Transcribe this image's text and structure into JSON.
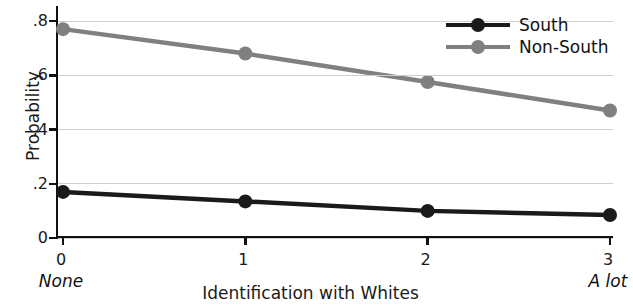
{
  "chart_data": {
    "type": "line",
    "title": "",
    "xlabel": "Identification with Whites",
    "ylabel": "Probability",
    "x": [
      0,
      1,
      2,
      3
    ],
    "xticklabels": [
      "0",
      "1",
      "2",
      "3"
    ],
    "x_end_labels": {
      "left": "None",
      "right": "A lot"
    },
    "xlim": [
      0,
      3
    ],
    "ylim": [
      0,
      0.8
    ],
    "yticks": [
      0,
      0.2,
      0.4,
      0.6,
      0.8
    ],
    "yticklabels": [
      "0",
      ".2",
      ".4",
      ".6",
      ".8"
    ],
    "grid": "horizontal",
    "legend_position": "top-right",
    "series": [
      {
        "name": "South",
        "color": "#1a1a1a",
        "values": [
          0.17,
          0.135,
          0.1,
          0.085
        ]
      },
      {
        "name": "Non-South",
        "color": "#808080",
        "values": [
          0.77,
          0.68,
          0.575,
          0.47
        ]
      }
    ]
  },
  "legend": {
    "items": [
      {
        "label": "South",
        "color": "#1a1a1a",
        "marker": "circle"
      },
      {
        "label": "Non-South",
        "color": "#808080",
        "marker": "circle"
      }
    ]
  },
  "axes": {
    "y_title": "Probability",
    "x_title": "Identification with Whites",
    "y_ticks": [
      {
        "label": ".8",
        "value": 0.8
      },
      {
        "label": ".6",
        "value": 0.6
      },
      {
        "label": ".4",
        "value": 0.4
      },
      {
        "label": ".2",
        "value": 0.2
      },
      {
        "label": "0",
        "value": 0
      }
    ],
    "x_ticks": [
      {
        "label": "0",
        "value": 0
      },
      {
        "label": "1",
        "value": 1
      },
      {
        "label": "2",
        "value": 2
      },
      {
        "label": "3",
        "value": 3
      }
    ],
    "x_left_anchor": "None",
    "x_right_anchor": "A lot"
  },
  "colors": {
    "south": "#1a1a1a",
    "non_south": "#808080",
    "gridline": "#cfcfcf",
    "axis": "#111111",
    "background": "#ffffff"
  }
}
